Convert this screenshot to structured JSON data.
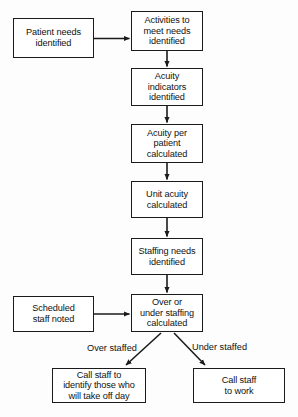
{
  "diagram": {
    "stroke_color": "#1b1b1b",
    "text_color": "#111111",
    "background_color": "#fdfdfd",
    "node_fill": "#ffffff"
  },
  "nodes": [
    {
      "id": "patient-needs-identified",
      "label": "Patient needs\nidentified",
      "x": 13,
      "y": 18,
      "w": 81,
      "h": 40
    },
    {
      "id": "activities-to-meet-needs-identified",
      "label": "Activities to\nmeet needs\nidentified",
      "x": 131,
      "y": 11,
      "w": 72,
      "h": 40
    },
    {
      "id": "acuity-indicators-identified",
      "label": "Acuity\nindicators\nidentified",
      "x": 131,
      "y": 68,
      "w": 72,
      "h": 38
    },
    {
      "id": "acuity-per-patient-calculated",
      "label": "Acuity per\npatient\ncalculated",
      "x": 131,
      "y": 124,
      "w": 72,
      "h": 39
    },
    {
      "id": "unit-acuity-calculated",
      "label": "Unit acuity\ncalculated",
      "x": 131,
      "y": 181,
      "w": 72,
      "h": 37
    },
    {
      "id": "staffing-needs-identified",
      "label": "Staffing needs\nidentified",
      "x": 131,
      "y": 238,
      "w": 72,
      "h": 37
    },
    {
      "id": "scheduled-staff-noted",
      "label": "Scheduled\nstaff noted",
      "x": 13,
      "y": 296,
      "w": 81,
      "h": 36
    },
    {
      "id": "over-or-under-staffing-calculated",
      "label": "Over or\nunder staffing\ncalculated",
      "x": 131,
      "y": 294,
      "w": 72,
      "h": 38
    },
    {
      "id": "call-staff-to-identify-those-who-will-take-off-day",
      "label": "Call staff to\nidentify those who\nwill take off day",
      "x": 52,
      "y": 368,
      "w": 94,
      "h": 35
    },
    {
      "id": "call-staff-to-work",
      "label": "Call staff\nto work",
      "x": 193,
      "y": 368,
      "w": 92,
      "h": 35
    }
  ],
  "edge_labels": [
    {
      "id": "over-staffed",
      "text": "Over staffed",
      "x": 87,
      "y": 343
    },
    {
      "id": "under-staffed",
      "text": "Under staffed",
      "x": 192,
      "y": 342
    }
  ],
  "edges": [
    {
      "id": "patient-needs-to-activities",
      "from": "patient-needs-identified",
      "to": "activities-to-meet-needs-identified",
      "kind": "horizontal"
    },
    {
      "id": "activities-to-acuity-indicators",
      "from": "activities-to-meet-needs-identified",
      "to": "acuity-indicators-identified",
      "kind": "vertical"
    },
    {
      "id": "acuity-indicators-to-acuity-per-patient",
      "from": "acuity-indicators-identified",
      "to": "acuity-per-patient-calculated",
      "kind": "vertical"
    },
    {
      "id": "acuity-per-patient-to-unit-acuity",
      "from": "acuity-per-patient-calculated",
      "to": "unit-acuity-calculated",
      "kind": "vertical"
    },
    {
      "id": "unit-acuity-to-staffing-needs",
      "from": "unit-acuity-calculated",
      "to": "staffing-needs-identified",
      "kind": "vertical"
    },
    {
      "id": "staffing-needs-to-over-under",
      "from": "staffing-needs-identified",
      "to": "over-or-under-staffing-calculated",
      "kind": "vertical"
    },
    {
      "id": "scheduled-staff-to-over-under",
      "from": "scheduled-staff-noted",
      "to": "over-or-under-staffing-calculated",
      "kind": "horizontal"
    },
    {
      "id": "over-under-to-call-off-day",
      "from": "over-or-under-staffing-calculated",
      "to": "call-staff-to-identify-those-who-will-take-off-day",
      "kind": "diagonal-left",
      "label": "Over staffed"
    },
    {
      "id": "over-under-to-call-to-work",
      "from": "over-or-under-staffing-calculated",
      "to": "call-staff-to-work",
      "kind": "diagonal-right",
      "label": "Under staffed"
    }
  ]
}
